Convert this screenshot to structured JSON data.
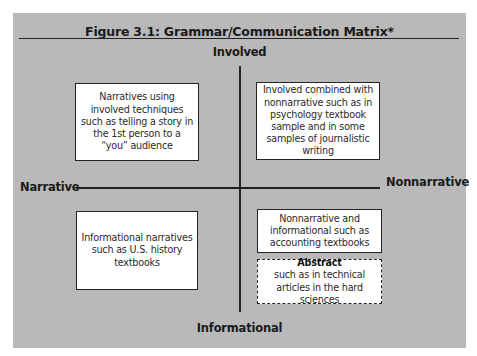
{
  "figure": {
    "title": "Figure 3.1:  Grammar/Communication Matrix*",
    "axes": {
      "top": "Involved",
      "bottom": "Informational",
      "left": "Narrative",
      "right": "Nonnarrative"
    },
    "quadrants": {
      "top_left": "Narratives using involved techniques such as telling a story in the 1st person to a “you” audience",
      "top_right": "Involved combined with nonnarrative such as in psychology textbook sample and in some samples of journalistic writing",
      "bottom_left": "Informational narratives such as U.S. history textbooks",
      "bottom_right": "Nonnarrative and informational such as accounting textbooks",
      "bottom_right_abstract": {
        "heading": "Abstract",
        "text": "such as in technical articles in the hard sciences"
      }
    }
  },
  "colors": {
    "panel_background": "#b9b9b9",
    "box_background": "#ffffff",
    "lines": "#222222"
  }
}
